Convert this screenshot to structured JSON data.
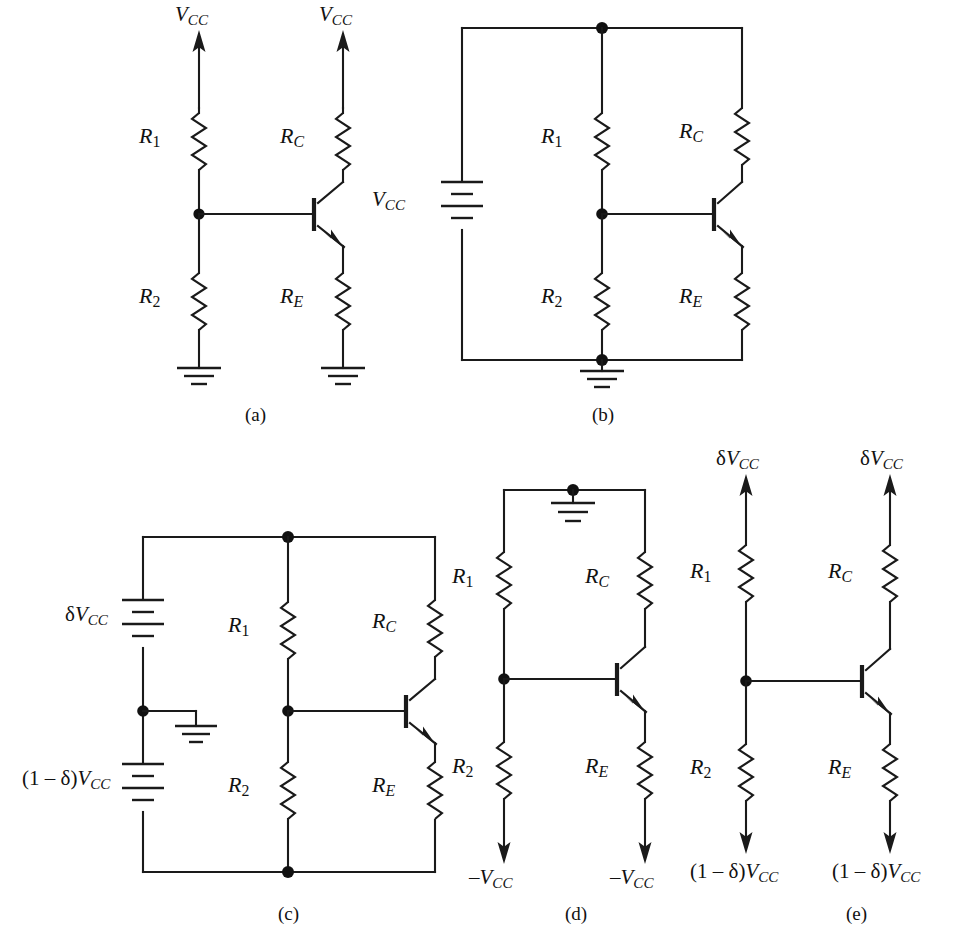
{
  "figure": {
    "caption_visible": "",
    "panels": [
      {
        "id": "a",
        "letter": "(a)"
      },
      {
        "id": "b",
        "letter": "(b)"
      },
      {
        "id": "c",
        "letter": "(c)"
      },
      {
        "id": "d",
        "letter": "(d)"
      },
      {
        "id": "e",
        "letter": "(e)"
      }
    ]
  },
  "labels": {
    "vcc": "V",
    "vcc_sub": "CC",
    "r1": "R",
    "r1_sub": "1",
    "r2": "R",
    "r2_sub": "2",
    "rc": "R",
    "rc_sub": "C",
    "re": "R",
    "re_sub": "E",
    "delta": "δ",
    "minus_vcc_prefix": "–",
    "one_minus_delta_open": "(1 – δ)"
  },
  "panel_a": {
    "supply_left": {
      "symbol": "V",
      "sub": "CC"
    },
    "supply_right": {
      "symbol": "V",
      "sub": "CC"
    },
    "resistors": [
      "R1",
      "RC",
      "R2",
      "RE"
    ],
    "ground_count": 2,
    "transistor": "npn",
    "letter": "(a)"
  },
  "panel_b": {
    "battery_label": {
      "symbol": "V",
      "sub": "CC"
    },
    "resistors": [
      "R1",
      "RC",
      "R2",
      "RE"
    ],
    "ground_count": 1,
    "transistor": "npn",
    "letter": "(b)"
  },
  "panel_c": {
    "battery_top_label": {
      "prefix": "δ",
      "symbol": "V",
      "sub": "CC"
    },
    "battery_bottom_label": {
      "prefix": "(1 – δ)",
      "symbol": "V",
      "sub": "CC"
    },
    "resistors": [
      "R1",
      "RC",
      "R2",
      "RE"
    ],
    "ground_count": 1,
    "transistor": "npn",
    "letter": "(c)"
  },
  "panel_d": {
    "top_ground": true,
    "bottom_left_label": {
      "prefix": "–",
      "symbol": "V",
      "sub": "CC"
    },
    "bottom_right_label": {
      "prefix": "–",
      "symbol": "V",
      "sub": "CC"
    },
    "resistors": [
      "R1",
      "RC",
      "R2",
      "RE"
    ],
    "transistor": "npn",
    "letter": "(d)"
  },
  "panel_e": {
    "top_left_label": {
      "prefix": "δ",
      "symbol": "V",
      "sub": "CC"
    },
    "top_right_label": {
      "prefix": "δ",
      "symbol": "V",
      "sub": "CC"
    },
    "bottom_left_label": {
      "prefix": "(1 – δ)",
      "symbol": "V",
      "sub": "CC"
    },
    "bottom_right_label": {
      "prefix": "(1 – δ)",
      "symbol": "V",
      "sub": "CC"
    },
    "resistors": [
      "R1",
      "RC",
      "R2",
      "RE"
    ],
    "transistor": "npn",
    "letter": "(e)"
  },
  "colors": {
    "ink": "#1a1a1a",
    "background": "#ffffff"
  },
  "text": {
    "vcc_plain": "VCC",
    "a": "(a)",
    "b": "(b)",
    "c": "(c)",
    "d": "(d)",
    "e": "(e)"
  }
}
